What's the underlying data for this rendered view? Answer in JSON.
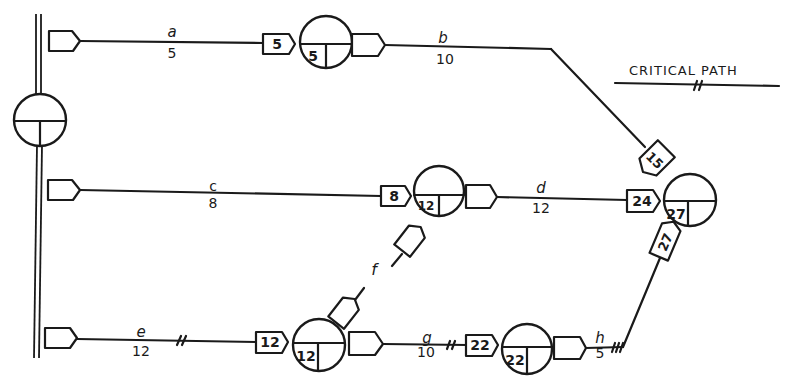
{
  "diagram": {
    "type": "precedence network (critical path method)",
    "legend": {
      "title": "CRITICAL PATH",
      "symbol": "//"
    },
    "start_node": {
      "id": "start",
      "early_start": ""
    },
    "activities": [
      {
        "id": "a",
        "label": "a",
        "duration": "5",
        "finish_tag": "5"
      },
      {
        "id": "b",
        "label": "b",
        "duration": "10",
        "finish_tag": "15"
      },
      {
        "id": "c",
        "label": "c",
        "duration": "8",
        "finish_tag": "8"
      },
      {
        "id": "d",
        "label": "d",
        "duration": "12",
        "finish_tag": "24"
      },
      {
        "id": "e",
        "label": "e",
        "duration": "12",
        "finish_tag": "12",
        "critical": true
      },
      {
        "id": "f",
        "label": "f",
        "duration": "",
        "dummy": true
      },
      {
        "id": "g",
        "label": "g",
        "duration": "10",
        "finish_tag": "22",
        "critical": true
      },
      {
        "id": "h",
        "label": "h",
        "duration": "5",
        "finish_tag": "27",
        "critical": true
      }
    ],
    "nodes": [
      {
        "id": "n1",
        "value": "5"
      },
      {
        "id": "n2",
        "value": "12"
      },
      {
        "id": "n3",
        "value": "12"
      },
      {
        "id": "n4",
        "value": "22"
      },
      {
        "id": "end",
        "value": "27"
      }
    ],
    "critical_path": [
      "e",
      "g",
      "h"
    ]
  }
}
